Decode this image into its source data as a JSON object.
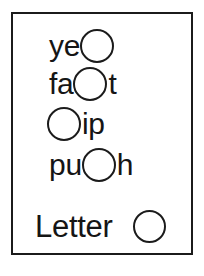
{
  "card": {
    "border_color": "#1b1b1b",
    "background": "#ffffff",
    "text_color": "#151515"
  },
  "rows": [
    {
      "id": "row-1",
      "word_parts": {
        "prefix": "ye",
        "suffix": ""
      },
      "blank_position": "end",
      "blank_icon": "circle-blank-icon"
    },
    {
      "id": "row-2",
      "word_parts": {
        "prefix": "fa",
        "suffix": "t"
      },
      "blank_position": "middle",
      "blank_icon": "circle-blank-icon"
    },
    {
      "id": "row-3",
      "word_parts": {
        "prefix": "",
        "suffix": "ip"
      },
      "blank_position": "start",
      "blank_icon": "circle-blank-icon"
    },
    {
      "id": "row-4",
      "word_parts": {
        "prefix": "pu",
        "suffix": "h"
      },
      "blank_position": "middle",
      "blank_icon": "circle-blank-icon"
    }
  ],
  "legend": {
    "label": "Letter",
    "blank_icon": "circle-blank-icon"
  }
}
